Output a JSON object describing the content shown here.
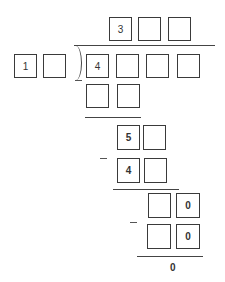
{
  "quotient": {
    "digits": [
      "3",
      "",
      ""
    ]
  },
  "divisor": {
    "digits": [
      "1",
      ""
    ]
  },
  "dividend": {
    "digits": [
      "4",
      "",
      "",
      ""
    ]
  },
  "steps": [
    {
      "label": "subtract-1",
      "digits": [
        "",
        ""
      ]
    },
    {
      "label": "remainder-1",
      "digits": [
        "5",
        ""
      ]
    },
    {
      "label": "subtract-2",
      "digits": [
        "4",
        ""
      ]
    },
    {
      "label": "remainder-2",
      "digits": [
        "",
        "0"
      ]
    },
    {
      "label": "subtract-3",
      "digits": [
        "",
        "0"
      ]
    }
  ],
  "final_remainder": "0",
  "colors": {
    "stroke": "#3a3a3a",
    "background": "#ffffff"
  }
}
